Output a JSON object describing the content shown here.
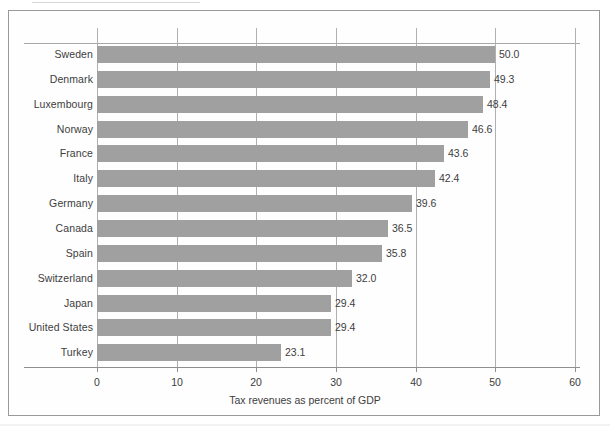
{
  "chart_data": {
    "type": "bar",
    "orientation": "horizontal",
    "title": "",
    "xlabel": "Tax revenues as percent of GDP",
    "ylabel": "",
    "xlim": [
      0,
      60
    ],
    "xticks": [
      0,
      10,
      20,
      30,
      40,
      50,
      60
    ],
    "grid": "vertical",
    "legend": "none",
    "bar_color": "#a0a0a0",
    "categories": [
      "Sweden",
      "Denmark",
      "Luxembourg",
      "Norway",
      "France",
      "Italy",
      "Germany",
      "Canada",
      "Spain",
      "Switzerland",
      "Japan",
      "United States",
      "Turkey"
    ],
    "values": [
      50.0,
      49.3,
      48.4,
      46.6,
      43.6,
      42.4,
      39.6,
      36.5,
      35.8,
      32.0,
      29.4,
      29.4,
      23.1
    ],
    "data_labels": [
      "50.0",
      "49.3",
      "48.4",
      "46.6",
      "43.6",
      "42.4",
      "39.6",
      "36.5",
      "35.8",
      "32.0",
      "29.4",
      "29.4",
      "23.1"
    ],
    "tick_labels": [
      "0",
      "10",
      "20",
      "30",
      "40",
      "50",
      "60"
    ]
  }
}
